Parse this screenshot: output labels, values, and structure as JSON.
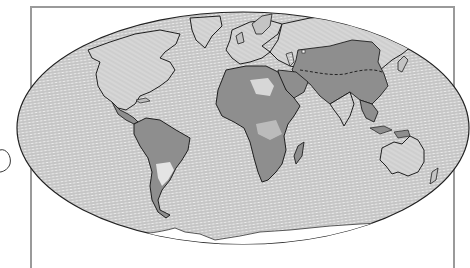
{
  "map": {
    "projection": "elliptical-equal-area",
    "style": "hand-drawn hatched illustration",
    "colors": {
      "background": "#ffffff",
      "frame": "#9a9a9a",
      "ocean_base": "#e9e9e9",
      "ocean_hatch": "#6f6f6f",
      "land_dark": "#8e8e8e",
      "land_light": "#d2d2d2",
      "desert_highlight": "#e4e4e4",
      "coastline": "#1e1e1e",
      "antarctic_ice": "#ffffff"
    },
    "regions": [
      {
        "name": "North America",
        "tone": "light"
      },
      {
        "name": "Central America",
        "tone": "dark"
      },
      {
        "name": "South America",
        "tone": "dark"
      },
      {
        "name": "Greenland",
        "tone": "light"
      },
      {
        "name": "Europe",
        "tone": "light"
      },
      {
        "name": "Africa",
        "tone": "dark"
      },
      {
        "name": "Arabian Peninsula",
        "tone": "dark"
      },
      {
        "name": "Asia (north)",
        "tone": "light"
      },
      {
        "name": "Asia (south/central)",
        "tone": "dark"
      },
      {
        "name": "Indian Subcontinent",
        "tone": "hatched"
      },
      {
        "name": "Southeast Asia",
        "tone": "dark"
      },
      {
        "name": "Australia",
        "tone": "light"
      },
      {
        "name": "Madagascar",
        "tone": "dark"
      },
      {
        "name": "Antarctica fringe",
        "tone": "white"
      }
    ],
    "annotations": [
      {
        "type": "dashed-line",
        "description": "boundary line across central Asia"
      }
    ]
  }
}
